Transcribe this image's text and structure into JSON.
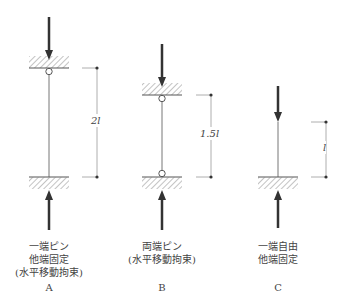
{
  "columns": [
    {
      "id": "A",
      "letter": "A",
      "caption": [
        "一端ピン",
        "他端固定",
        "(水平移動拘束)"
      ],
      "length_label": "2l",
      "top_support": "fixed-with-pin",
      "bottom_support": "fixed"
    },
    {
      "id": "B",
      "letter": "B",
      "caption": [
        "両端ピン",
        "(水平移動拘束)"
      ],
      "length_label": "1.5l",
      "top_support": "pin",
      "bottom_support": "pin"
    },
    {
      "id": "C",
      "letter": "C",
      "caption": [
        "一端自由",
        "他端固定"
      ],
      "length_label": "l",
      "top_support": "free",
      "bottom_support": "fixed"
    }
  ],
  "colors": {
    "line": "#555555",
    "arrow": "#333333",
    "hatch": "#777777"
  }
}
